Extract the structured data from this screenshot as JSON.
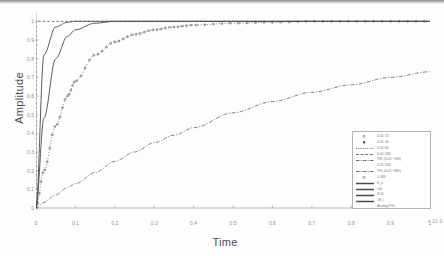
{
  "figure": {
    "kind": "step-response-plot",
    "background": "#ffffff",
    "line_color": "#4a4a4a",
    "axis_color": "#9a9a9a",
    "text_color": "#7b7b7b"
  },
  "axes": {
    "xlabel": "Time",
    "ylabel": "Amplitude",
    "xticks": [
      "0",
      "0.1",
      "0.2",
      "0.3",
      "0.4",
      "0.5",
      "0.6",
      "0.7",
      "0.8",
      "0.9",
      "1"
    ],
    "xtick_values": [
      0,
      0.1,
      0.2,
      0.3,
      0.4,
      0.5,
      0.6,
      0.7,
      0.8,
      0.9,
      1.0
    ],
    "yticks": [
      "0",
      "0.1",
      "0.2",
      "0.3",
      "0.4",
      "0.5",
      "0.6",
      "0.7",
      "0.8",
      "0.9",
      "1"
    ],
    "ytick_values": [
      0,
      0.1,
      0.2,
      0.3,
      0.4,
      0.5,
      0.6,
      0.7,
      0.8,
      0.9,
      1.0
    ],
    "xlim": [
      0,
      1
    ],
    "ylim": [
      0,
      1.05
    ],
    "x_exponent": "-3",
    "grid": false
  },
  "legend": {
    "position": "lower-right",
    "entries": [
      {
        "label": "0.01.73",
        "style": "marker-only",
        "marker": "open-circle"
      },
      {
        "label": "0.01.40",
        "style": "marker-only",
        "marker": "filled-square"
      },
      {
        "label": "0.01.80",
        "style": "dotted"
      },
      {
        "label": "0.01.180",
        "style": "dashed"
      },
      {
        "label": "PID (0.01~180)",
        "style": "dash-dot"
      },
      {
        "label": "0.01.530",
        "style": "none"
      },
      {
        "label": "PID (0.01~380)",
        "style": "dash-dot"
      },
      {
        "label": "1.089",
        "style": "marker-only",
        "marker": "open-circle"
      },
      {
        "label": "K_p",
        "style": "solid-thick"
      },
      {
        "label": "Gd",
        "style": "solid-thick"
      },
      {
        "label": "KCD",
        "style": "solid-thick"
      },
      {
        "label": "JN_i",
        "style": "solid-thick"
      },
      {
        "label": "Analog PID",
        "style": "none"
      }
    ]
  },
  "chart_data": {
    "type": "line",
    "title": "",
    "xlabel": "Time",
    "ylabel": "Amplitude",
    "xlim": [
      0,
      1
    ],
    "ylim": [
      0,
      1.05
    ],
    "grid": false,
    "legend_position": "lower-right",
    "x": [
      0,
      0.02,
      0.05,
      0.08,
      0.1,
      0.15,
      0.2,
      0.25,
      0.3,
      0.35,
      0.4,
      0.5,
      0.6,
      0.7,
      0.8,
      0.9,
      1.0
    ],
    "series": [
      {
        "name": "step-reference",
        "style": "dashed-vertical",
        "values": [
          0,
          1.0,
          1.0,
          1.0,
          1.0,
          1.0,
          1.0,
          1.0,
          1.0,
          1.0,
          1.0,
          1.0,
          1.0,
          1.0,
          1.0,
          1.0,
          1.0
        ]
      },
      {
        "name": "fast-solid-1",
        "style": "solid",
        "values": [
          0,
          0.82,
          0.97,
          0.995,
          1.0,
          1.0,
          1.0,
          1.0,
          1.0,
          1.0,
          1.0,
          1.0,
          1.0,
          1.0,
          1.0,
          1.0,
          1.0
        ]
      },
      {
        "name": "fast-solid-2",
        "style": "solid",
        "values": [
          0,
          0.48,
          0.8,
          0.92,
          0.955,
          0.99,
          1.0,
          1.0,
          1.0,
          1.0,
          1.0,
          1.0,
          1.0,
          1.0,
          1.0,
          1.0,
          1.0
        ]
      },
      {
        "name": "marker-dotted",
        "style": "dotted-markers",
        "values": [
          0,
          0.2,
          0.44,
          0.6,
          0.68,
          0.82,
          0.89,
          0.93,
          0.955,
          0.97,
          0.98,
          0.99,
          0.995,
          1.0,
          1.0,
          1.0,
          1.0
        ]
      },
      {
        "name": "slow-rising",
        "style": "dash-dot",
        "values": [
          0,
          0.03,
          0.07,
          0.11,
          0.13,
          0.19,
          0.25,
          0.3,
          0.35,
          0.39,
          0.43,
          0.51,
          0.57,
          0.62,
          0.66,
          0.7,
          0.73
        ]
      }
    ]
  }
}
